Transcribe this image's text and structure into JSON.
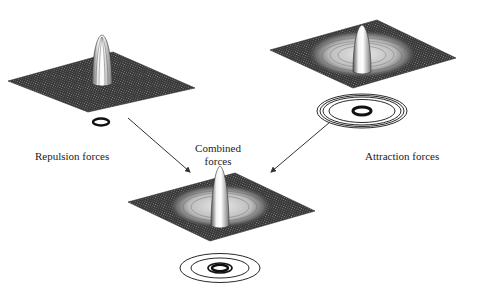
{
  "diagram": {
    "panels": [
      {
        "id": "repulsion",
        "label": "Repulsion forces"
      },
      {
        "id": "attraction",
        "label": "Attraction forces"
      },
      {
        "id": "combined",
        "label_line1": "Combined",
        "label_line2": "forces"
      }
    ],
    "colors": {
      "surface": "#3a3a3a",
      "mesh": "#ffffff",
      "line": "#333333",
      "background": "#ffffff"
    }
  }
}
